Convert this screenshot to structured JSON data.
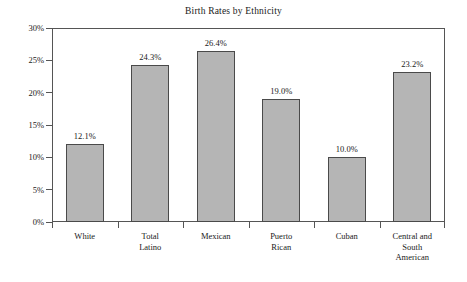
{
  "chart_data": {
    "type": "bar",
    "title": "Birth Rates by Ethnicity",
    "xlabel": "",
    "ylabel": "",
    "ylim": [
      0,
      30
    ],
    "grid": false,
    "legend": "none",
    "y_tick_labels": [
      "30%",
      "25%",
      "20%",
      "15%",
      "10%",
      "5%",
      "0%"
    ],
    "y_tick_values": [
      30,
      25,
      20,
      15,
      10,
      5,
      0
    ],
    "categories": [
      "White",
      "Total Latino",
      "Mexican",
      "Puerto Rican",
      "Cuban",
      "Central and South American"
    ],
    "category_lines": [
      [
        "White"
      ],
      [
        "Total",
        "Latino"
      ],
      [
        "Mexican"
      ],
      [
        "Puerto",
        "Rican"
      ],
      [
        "Cuban"
      ],
      [
        "Central and",
        "South",
        "American"
      ]
    ],
    "values": [
      12.1,
      24.3,
      26.4,
      19.0,
      10.0,
      23.2
    ],
    "data_labels": [
      "12.1%",
      "24.3%",
      "26.4%",
      "19.0%",
      "10.0%",
      "23.2%"
    ],
    "bar_fill_color": "#b5b5b5",
    "bar_border_color": "#4a4a4a",
    "axis_color": "#555555",
    "text_color": "#1a1a1a",
    "background_color": "#ffffff"
  }
}
